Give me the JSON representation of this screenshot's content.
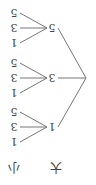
{
  "diagram": {
    "type": "tree",
    "orientation": "rotated-180",
    "levels": [
      {
        "header": "大",
        "nodes": [
          "1",
          "3",
          "5"
        ]
      },
      {
        "header": "小",
        "children_per_node": [
          "1",
          "3",
          "5"
        ]
      }
    ],
    "tree": [
      {
        "label": "1",
        "children": [
          "1",
          "3",
          "5"
        ]
      },
      {
        "label": "3",
        "children": [
          "1",
          "3",
          "5"
        ]
      },
      {
        "label": "5",
        "children": [
          "1",
          "3",
          "5"
        ]
      }
    ],
    "headers": {
      "big": "大",
      "small": "小"
    }
  }
}
